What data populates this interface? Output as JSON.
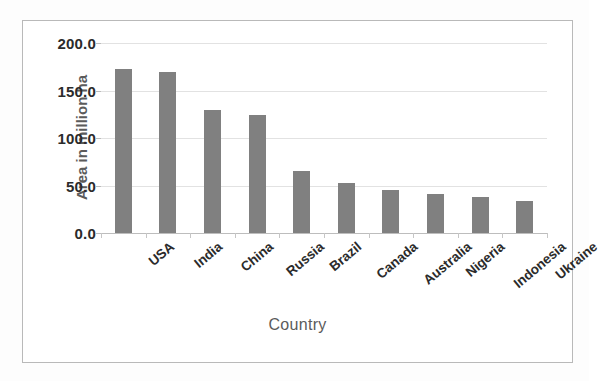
{
  "chart_data": {
    "type": "bar",
    "title": "",
    "xlabel": "Country",
    "ylabel": "Area in million ha",
    "categories": [
      "USA",
      "India",
      "China",
      "Russia",
      "Brazil",
      "Canada",
      "Australia",
      "Nigeria",
      "Indonesia",
      "Ukraine"
    ],
    "values": [
      173,
      169,
      130,
      124,
      65,
      53,
      45,
      41,
      38,
      34
    ],
    "ylim": [
      0,
      200
    ],
    "ytick_values": [
      0,
      50,
      100,
      150,
      200
    ],
    "ytick_labels": [
      "0.0",
      "50.0",
      "100.0",
      "150.0",
      "200.0"
    ],
    "grid": true,
    "legend": "none",
    "series_color": "#808080",
    "gridline_color": "#e2e2e2",
    "axis_color": "#bdbdbd",
    "frame_color": "#b9b9b9",
    "label_color": "#2b2b2b",
    "axis_title_color": "#5b5b5b"
  },
  "page": {
    "below_text": ""
  }
}
